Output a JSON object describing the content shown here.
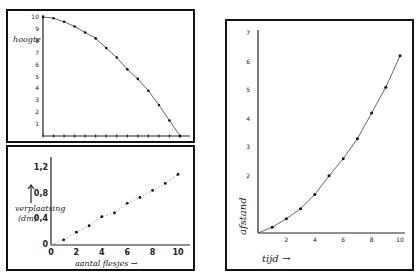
{
  "chart_data": [
    {
      "type": "line",
      "title": "",
      "xlabel": "",
      "ylabel": "hoogte",
      "xlim": [
        0,
        13
      ],
      "ylim": [
        0,
        10
      ],
      "yticks": [
        "1",
        "2",
        "3",
        "4",
        "5",
        "6",
        "7",
        "8",
        "9",
        "10"
      ],
      "grid": false,
      "x": [
        0,
        1,
        2,
        3,
        4,
        5,
        6,
        7,
        8,
        9,
        10,
        11,
        12,
        13
      ],
      "values": [
        10,
        9.9,
        9.6,
        9.2,
        8.7,
        8.2,
        7.4,
        6.6,
        5.6,
        4.8,
        3.8,
        2.6,
        1.3,
        0
      ]
    },
    {
      "type": "scatter",
      "title": "",
      "xlabel": "aantal flesjes",
      "ylabel": "verplaatsing (dm)",
      "xlim": [
        0,
        10
      ],
      "ylim": [
        0,
        1.2
      ],
      "xticks": [
        "0",
        "2",
        "4",
        "6",
        "8",
        "10"
      ],
      "yticks": [
        "0",
        "0.4",
        "0.8",
        "1.2"
      ],
      "grid": false,
      "x": [
        1,
        2,
        3,
        4,
        5,
        6,
        7,
        8,
        9,
        10
      ],
      "values": [
        0.08,
        0.2,
        0.3,
        0.44,
        0.5,
        0.65,
        0.74,
        0.85,
        0.96,
        1.1
      ]
    },
    {
      "type": "line",
      "title": "",
      "xlabel": "tijd",
      "ylabel": "afstand",
      "xlim": [
        0,
        10
      ],
      "ylim": [
        0,
        7
      ],
      "xticks": [
        "2",
        "4",
        "6",
        "8",
        "10"
      ],
      "yticks": [
        "2",
        "3",
        "4",
        "5",
        "6",
        "7"
      ],
      "grid": false,
      "x": [
        1,
        2,
        3,
        4,
        5,
        6,
        7,
        8,
        9,
        10
      ],
      "values": [
        0.2,
        0.5,
        0.85,
        1.35,
        2.0,
        2.6,
        3.3,
        4.2,
        5.1,
        6.2
      ]
    }
  ],
  "labels": {
    "chart1_ylabel": "hoogte",
    "chart2_ylabel_line1": "verplaatsing",
    "chart2_ylabel_line2": "(dm)",
    "chart2_xlabel": "aantal flesjes →",
    "chart3_ylabel": "afstand",
    "chart3_xlabel": "tijd →"
  }
}
